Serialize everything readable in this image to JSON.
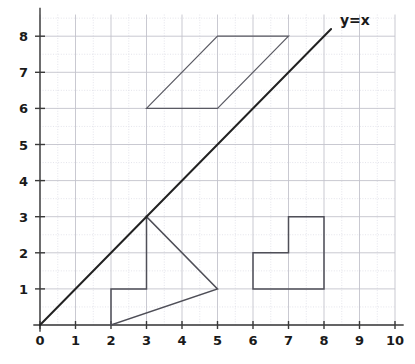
{
  "chart_data": {
    "type": "line",
    "title": "",
    "xlabel": "",
    "ylabel": "",
    "xlim": [
      0,
      10
    ],
    "ylim": [
      0,
      8.6
    ],
    "grid": true,
    "grid_major_step": 1,
    "grid_minor_step": 0.5,
    "legend": "none",
    "x_ticks": [
      "0",
      "1",
      "2",
      "3",
      "4",
      "5",
      "6",
      "7",
      "8",
      "9",
      "10"
    ],
    "x_tick_values": [
      0,
      1,
      2,
      3,
      4,
      5,
      6,
      7,
      8,
      9,
      10
    ],
    "y_ticks": [
      "1",
      "2",
      "3",
      "4",
      "5",
      "6",
      "7",
      "8"
    ],
    "y_tick_values": [
      1,
      2,
      3,
      4,
      5,
      6,
      7,
      8
    ],
    "origin_label": "0",
    "series": [
      {
        "name": "y=x",
        "kind": "line",
        "label": "y=x",
        "label_position": [
          8.45,
          8.45
        ],
        "color": "#222222",
        "points": [
          [
            0,
            0
          ],
          [
            8.2,
            8.2
          ]
        ]
      }
    ],
    "annotations": [
      {
        "name": "parallelogram",
        "kind": "polygon",
        "closed": true,
        "color": "#5a5a63",
        "points": [
          [
            3,
            6
          ],
          [
            5,
            6
          ],
          [
            7,
            8
          ],
          [
            5,
            8
          ]
        ]
      },
      {
        "name": "arrow-triangle-figure",
        "kind": "polygon",
        "closed": true,
        "color": "#4f4f58",
        "points": [
          [
            2,
            0
          ],
          [
            2,
            1
          ],
          [
            3,
            1
          ],
          [
            3,
            3
          ],
          [
            5,
            1
          ]
        ]
      },
      {
        "name": "step-l-shape",
        "kind": "polygon",
        "closed": true,
        "color": "#4f4f58",
        "points": [
          [
            6,
            1
          ],
          [
            8,
            1
          ],
          [
            8,
            3
          ],
          [
            7,
            3
          ],
          [
            7,
            2
          ],
          [
            6,
            2
          ]
        ]
      }
    ]
  },
  "colors": {
    "background": "#ffffff",
    "axis": "#3a3a3a",
    "grid_major": "#c3c3cc",
    "grid_minor": "#d9d9e2",
    "function_line": "#222222",
    "shape_stroke": "#4f4f58",
    "tick_text": "#1a1a1a"
  }
}
